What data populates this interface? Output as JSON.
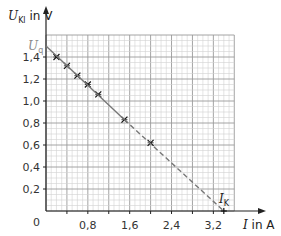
{
  "chart_data": {
    "type": "line",
    "title": "",
    "xlabel": "I in A",
    "ylabel": "U_Kl in V",
    "xlim": [
      0,
      3.6
    ],
    "ylim": [
      0,
      1.6
    ],
    "grid": true,
    "x_ticks": [
      "0",
      "0,8",
      "1,6",
      "2,4",
      "3,2"
    ],
    "y_ticks": [
      "0,2",
      "0,4",
      "0,6",
      "0,8",
      "1,0",
      "1,2",
      "1,4"
    ],
    "annotations": [
      "U_q",
      "I_K"
    ],
    "series": [
      {
        "name": "measured points",
        "style": "cross markers",
        "x": [
          0.2,
          0.4,
          0.6,
          0.8,
          1.0,
          1.5,
          2.0
        ],
        "y": [
          1.4,
          1.32,
          1.23,
          1.15,
          1.06,
          0.83,
          0.62
        ]
      },
      {
        "name": "fit line (solid)",
        "style": "solid",
        "x": [
          0,
          1.5
        ],
        "y": [
          1.5,
          0.83
        ]
      },
      {
        "name": "extrapolation (dashed)",
        "style": "dashed",
        "x": [
          1.5,
          3.4
        ],
        "y": [
          0.83,
          0
        ]
      }
    ],
    "U_q": 1.5,
    "I_K": 3.4
  },
  "labels": {
    "y_axis_main": "U",
    "y_axis_sub": "Kl",
    "y_axis_unit": " in V",
    "x_axis_var": "I",
    "x_axis_unit": " in A",
    "uq_main": "U",
    "uq_sub": "q",
    "ik_main": "I",
    "ik_sub": "K",
    "origin": "0"
  }
}
